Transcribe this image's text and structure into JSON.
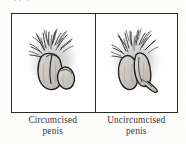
{
  "document": {
    "type": "scanned-figure",
    "background_color": "#fdfdfc",
    "ink_color": "#2a2a2a",
    "caption_color": "#3a3a3a",
    "partial_text_top": "py y"
  },
  "figure": {
    "border_color": "#2a2a2a",
    "panels": [
      {
        "id": "left",
        "illustration_name": "circumcised-penis-illustration",
        "description": "pen-and-ink line drawing of a circumcised penis with scrotum and pubic hair, pencil-shaded halo",
        "caption_line1": "Circumcised",
        "caption_line2": "penis"
      },
      {
        "id": "right",
        "illustration_name": "uncircumcised-penis-illustration",
        "description": "pen-and-ink line drawing of an uncircumcised penis with foreskin, scrotum and pubic hair, pencil-shaded halo",
        "caption_line1": "Uncircumcised",
        "caption_line2": "penis"
      }
    ]
  }
}
